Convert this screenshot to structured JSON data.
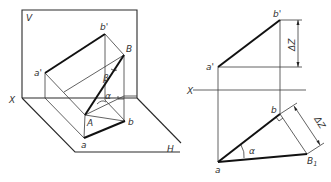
{
  "diagram": {
    "left_view": {
      "planes": {
        "vertical": "V",
        "horizontal": "H",
        "axis": "X"
      },
      "points": {
        "a_prime": "a'",
        "b_prime": "b'",
        "upper": "B",
        "lower": "A",
        "a": "a",
        "b": "b"
      },
      "angles": {
        "alpha": "α",
        "beta": "β"
      }
    },
    "right_view": {
      "axis": "X",
      "points": {
        "a_prime": "a'",
        "b_prime": "b'",
        "a": "a",
        "b": "b",
        "B1_main": "B",
        "B1_sub": "1"
      },
      "dimensions": {
        "dz_top": "ΔZ",
        "dz_side": "ΔZ"
      },
      "angles": {
        "alpha": "α"
      }
    }
  },
  "colors": {
    "line": "#111111",
    "thin": "#3a3a3a",
    "label": "#333333",
    "background": "#ffffff"
  }
}
